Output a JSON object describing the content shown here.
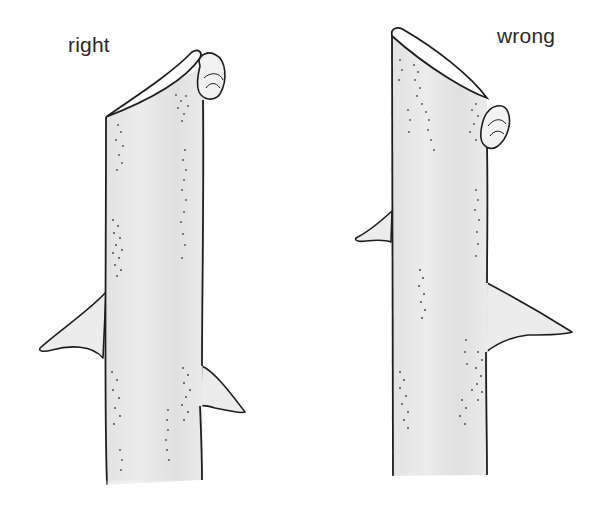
{
  "illustration": {
    "subject": "pruning cut above a bud on a rose stem",
    "panels": [
      {
        "label": "right",
        "cut": "slanted cut just above bud, sloping away from bud",
        "thorns": 2
      },
      {
        "label": "wrong",
        "cut": "long slanted cut far above bud, sloping toward bud",
        "thorns": 2
      }
    ]
  },
  "colors": {
    "outline": "#1e1e1e",
    "stem_fill": "#e6e6e6",
    "stipple": "#4a4a4a",
    "background": "#ffffff"
  }
}
